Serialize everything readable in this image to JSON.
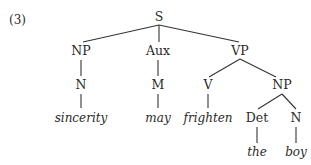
{
  "example_number": "(3)",
  "tree": {
    "nodes": [
      {
        "id": "S",
        "label": "S",
        "x": 159,
        "y": 11
      },
      {
        "id": "NP1",
        "label": "NP",
        "x": 81,
        "y": 45
      },
      {
        "id": "Aux",
        "label": "Aux",
        "x": 158,
        "y": 45
      },
      {
        "id": "VP",
        "label": "VP",
        "x": 240,
        "y": 45
      },
      {
        "id": "N1",
        "label": "N",
        "x": 81,
        "y": 79
      },
      {
        "id": "M",
        "label": "M",
        "x": 158,
        "y": 79
      },
      {
        "id": "V",
        "label": "V",
        "x": 208,
        "y": 79
      },
      {
        "id": "NP2",
        "label": "NP",
        "x": 282,
        "y": 79
      },
      {
        "id": "Det",
        "label": "Det",
        "x": 257,
        "y": 112
      },
      {
        "id": "N2",
        "label": "N",
        "x": 296,
        "y": 112
      }
    ],
    "leaves": [
      {
        "id": "w1",
        "label": "sincerity",
        "x": 81,
        "y": 112
      },
      {
        "id": "w2",
        "label": "may",
        "x": 158,
        "y": 112
      },
      {
        "id": "w3",
        "label": "frighten",
        "x": 208,
        "y": 112
      },
      {
        "id": "w4",
        "label": "the",
        "x": 257,
        "y": 146
      },
      {
        "id": "w5",
        "label": "boy",
        "x": 296,
        "y": 146
      }
    ],
    "edges": [
      [
        "S",
        "NP1"
      ],
      [
        "S",
        "Aux"
      ],
      [
        "S",
        "VP"
      ],
      [
        "NP1",
        "N1"
      ],
      [
        "Aux",
        "M"
      ],
      [
        "VP",
        "V"
      ],
      [
        "VP",
        "NP2"
      ],
      [
        "N1",
        "w1"
      ],
      [
        "M",
        "w2"
      ],
      [
        "V",
        "w3"
      ],
      [
        "NP2",
        "Det"
      ],
      [
        "NP2",
        "N2"
      ],
      [
        "Det",
        "w4"
      ],
      [
        "N2",
        "w5"
      ]
    ]
  }
}
